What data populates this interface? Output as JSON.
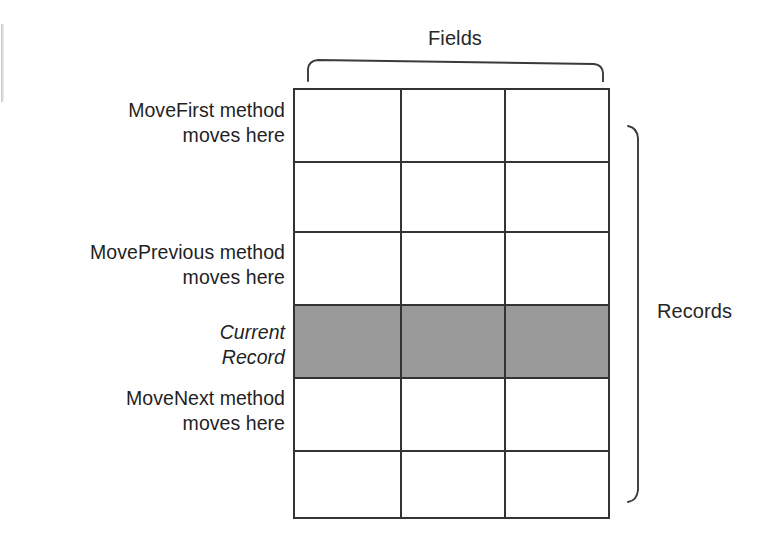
{
  "diagram": {
    "title_top": "Fields",
    "title_right": "Records",
    "grid": {
      "columns": 3,
      "rows": 6,
      "highlighted_row_index": 3,
      "highlight_color": "#999999",
      "line_color": "#333333",
      "cell_fill": "#ffffff"
    },
    "callouts": [
      {
        "id": "movefirst",
        "line1": "MoveFirst method",
        "line2": "moves here",
        "style": "normal",
        "target_row": 0
      },
      {
        "id": "moveprevious",
        "line1": "MovePrevious method",
        "line2": "moves here",
        "style": "normal",
        "target_row": 2
      },
      {
        "id": "current-record",
        "line1": "Current",
        "line2": "Record",
        "style": "italic",
        "target_row": 3
      },
      {
        "id": "movenext",
        "line1": "MoveNext method",
        "line2": "moves here",
        "style": "normal",
        "target_row": 4
      }
    ]
  }
}
